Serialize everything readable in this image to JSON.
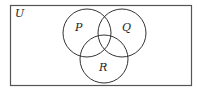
{
  "diagram": {
    "type": "venn",
    "universe": {
      "label": "U"
    },
    "sets": [
      {
        "label": "P"
      },
      {
        "label": "Q"
      },
      {
        "label": "R"
      }
    ],
    "colors": {
      "stroke": "#333333",
      "background": "#ffffff"
    }
  }
}
